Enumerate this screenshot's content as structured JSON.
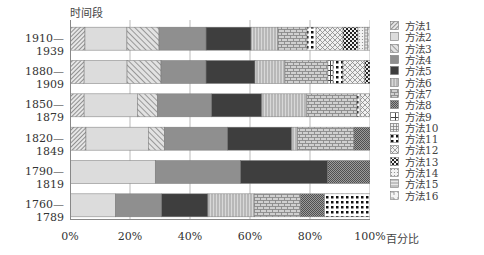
{
  "chart_data": {
    "type": "bar",
    "orientation": "horizontal",
    "stacked": true,
    "normalized": true,
    "title": "",
    "xlabel": "百分比",
    "ylabel": "时间段",
    "xlim": [
      0,
      100
    ],
    "x_ticks": [
      "0%",
      "20%",
      "40%",
      "60%",
      "80%",
      "100%"
    ],
    "grid": "vertical",
    "legend_position": "right",
    "categories": [
      "1910—1939",
      "1880—1909",
      "1850—1879",
      "1820—1849",
      "1790—1819",
      "1760—1789"
    ],
    "series": [
      {
        "name": "方法1",
        "pattern": "diag-dense",
        "values": [
          5.0,
          4.7,
          4.7,
          5.3,
          0,
          0
        ]
      },
      {
        "name": "方法2",
        "pattern": "light-gray",
        "values": [
          14.0,
          14.3,
          17.7,
          20.7,
          28.3,
          15.0
        ]
      },
      {
        "name": "方法3",
        "pattern": "diag-sparse",
        "values": [
          10.7,
          11.3,
          6.7,
          5.3,
          0,
          0
        ]
      },
      {
        "name": "方法4",
        "pattern": "mid-gray",
        "values": [
          15.7,
          15.0,
          18.0,
          21.0,
          28.3,
          15.3
        ]
      },
      {
        "name": "方法5",
        "pattern": "dark-gray",
        "values": [
          15.0,
          16.3,
          16.7,
          21.3,
          29.0,
          15.3
        ]
      },
      {
        "name": "方法6",
        "pattern": "vertical-lines",
        "values": [
          9.0,
          10.0,
          15.0,
          2.0,
          0,
          15.3
        ]
      },
      {
        "name": "方法7",
        "pattern": "brick",
        "values": [
          9.7,
          14.3,
          16.7,
          18.7,
          0,
          15.3
        ]
      },
      {
        "name": "方法8",
        "pattern": "dense-dots",
        "values": [
          0,
          0,
          0,
          5.3,
          14.0,
          8.0
        ]
      },
      {
        "name": "方法9",
        "pattern": "grid-open",
        "values": [
          0,
          1.7,
          0,
          0,
          0,
          0
        ]
      },
      {
        "name": "方法10",
        "pattern": "grid-fine",
        "values": [
          0,
          0,
          0,
          0,
          0,
          0
        ]
      },
      {
        "name": "方法11",
        "pattern": "black-dots",
        "values": [
          3.0,
          3.3,
          1.0,
          0,
          0,
          15.0
        ]
      },
      {
        "name": "方法12",
        "pattern": "diag-cross",
        "values": [
          9.0,
          7.3,
          3.3,
          0,
          0,
          0
        ]
      },
      {
        "name": "方法13",
        "pattern": "checker",
        "values": [
          5.0,
          1.7,
          0,
          0,
          0,
          0
        ]
      },
      {
        "name": "方法14",
        "pattern": "light-dots",
        "values": [
          2.3,
          0,
          0,
          0,
          0,
          0
        ]
      },
      {
        "name": "方法15",
        "pattern": "horizontal-lines",
        "values": [
          1.0,
          0,
          0,
          0,
          0,
          0
        ]
      },
      {
        "name": "方法16",
        "pattern": "corner",
        "values": [
          0.7,
          0,
          0,
          0,
          0,
          0
        ]
      }
    ]
  },
  "axis": {
    "y_title": "时间段",
    "x_title": "百分比",
    "ticks": [
      {
        "label": "0%",
        "pos": 0
      },
      {
        "label": "20%",
        "pos": 20
      },
      {
        "label": "40%",
        "pos": 40
      },
      {
        "label": "60%",
        "pos": 60
      },
      {
        "label": "80%",
        "pos": 80
      },
      {
        "label": "100%",
        "pos": 100
      }
    ]
  }
}
